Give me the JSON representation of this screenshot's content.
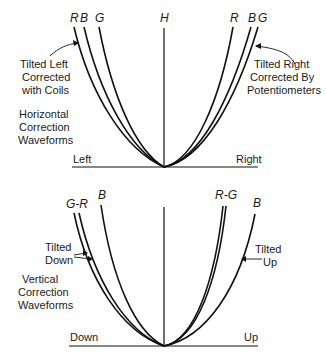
{
  "top_panel": {
    "curve_labels_left": [
      "R",
      "B",
      "G"
    ],
    "curve_label_center": "H",
    "curve_labels_right": [
      "R",
      "B",
      "G"
    ],
    "annotation_left": [
      "Tilted Left",
      "Corrected",
      "with Coils"
    ],
    "annotation_right": [
      "Tilted Right",
      "Corrected By",
      "Potentiometers"
    ],
    "title": [
      "Horizontal",
      "Correction",
      "Waveforms"
    ],
    "axis_left": "Left",
    "axis_right": "Right"
  },
  "bottom_panel": {
    "curve_label_left_pair": "G-R",
    "curve_label_left_b": "B",
    "curve_label_right_pair": "R-G",
    "curve_label_right_b": "B",
    "annotation_left": [
      "Tilted",
      "Down"
    ],
    "annotation_right": [
      "Tilted",
      "Up"
    ],
    "title": [
      "Vertical",
      "Correction",
      "Waveforms"
    ],
    "axis_left": "Down",
    "axis_right": "Up"
  }
}
